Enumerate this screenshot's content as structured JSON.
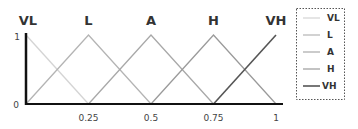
{
  "chart_data": {
    "type": "line",
    "title": "",
    "xlabel": "",
    "ylabel": "",
    "xlim": [
      0,
      1
    ],
    "ylim": [
      0,
      1
    ],
    "x_ticks": [
      "0.25",
      "0.5",
      "0.75",
      "1"
    ],
    "y_ticks": [
      "0",
      "1"
    ],
    "grid": false,
    "legend_position": "right",
    "top_labels": [
      "VL",
      "L",
      "A",
      "H",
      "VH"
    ],
    "series": [
      {
        "name": "VL",
        "x": [
          0,
          0.25
        ],
        "y": [
          1,
          0
        ],
        "color": "#d4d4d4"
      },
      {
        "name": "L",
        "x": [
          0,
          0.25,
          0.5
        ],
        "y": [
          0,
          1,
          0
        ],
        "color": "#b4b4b4"
      },
      {
        "name": "A",
        "x": [
          0.25,
          0.5,
          0.75
        ],
        "y": [
          0,
          1,
          0
        ],
        "color": "#a8a8a8"
      },
      {
        "name": "H",
        "x": [
          0.5,
          0.75,
          1
        ],
        "y": [
          0,
          1,
          0
        ],
        "color": "#9a9a9a"
      },
      {
        "name": "VH",
        "x": [
          0.75,
          1
        ],
        "y": [
          0,
          1
        ],
        "color": "#555555"
      }
    ]
  },
  "axis": {
    "y_zero": "0",
    "y_one": "1"
  },
  "legend": [
    "VL",
    "L",
    "A",
    "H",
    "VH"
  ]
}
